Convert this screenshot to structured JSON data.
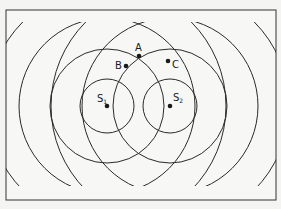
{
  "diagram": {
    "sources": [
      {
        "id": "S1",
        "label": "S",
        "subscript": "1",
        "x": 107,
        "y": 106
      },
      {
        "id": "S2",
        "label": "S",
        "subscript": "2",
        "x": 170,
        "y": 106
      }
    ],
    "radii": [
      27,
      57,
      88,
      119
    ],
    "points": [
      {
        "id": "A",
        "label": "A",
        "x": 139,
        "y": 56
      },
      {
        "id": "B",
        "label": "B",
        "x": 126,
        "y": 66
      },
      {
        "id": "C",
        "label": "C",
        "x": 168,
        "y": 61
      }
    ],
    "colors": {
      "line": "#2a2a2a",
      "frame": "#333333",
      "background": "#f4f4f2"
    }
  }
}
